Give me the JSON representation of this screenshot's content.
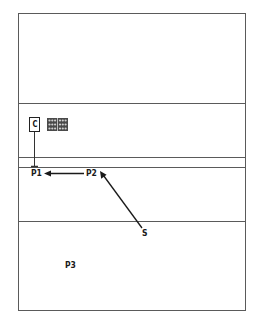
{
  "diagram": {
    "type": "schematic-layout",
    "frame": {
      "x": 18,
      "y": 13,
      "width": 228,
      "height": 298,
      "stroke": "#555555"
    },
    "dividers": [
      {
        "y": 103
      },
      {
        "y": 157
      },
      {
        "y": 167
      },
      {
        "y": 221
      }
    ],
    "labels": {
      "c": "C",
      "p1": "P1",
      "p2": "P2",
      "p3": "P3",
      "s": "S"
    },
    "icons": {
      "component_box": "c-box",
      "grid_panel": "grid-pattern-icon"
    },
    "arrows": [
      {
        "from": "P2",
        "to": "P1",
        "direction": "left"
      },
      {
        "from": "S",
        "to": "P2",
        "direction": "up-left"
      }
    ],
    "colors": {
      "line": "#3a3a3a",
      "text": "#1a1a1a",
      "background": "#ffffff"
    }
  }
}
